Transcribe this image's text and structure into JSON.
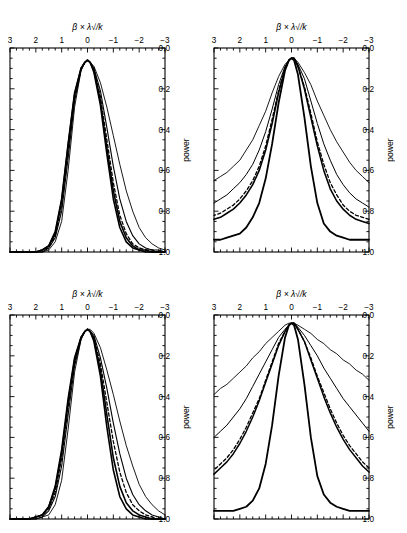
{
  "figure": {
    "kind": "multi-panel-line-plot",
    "orientation": "rotated-180",
    "panel_count": 4,
    "line_color": "#000000"
  },
  "axes": {
    "xlabel": "β × λ√/k",
    "ylabel": "power",
    "xticks": [
      "-3",
      "-2",
      "-1",
      "0",
      "1",
      "2",
      "3"
    ],
    "yticks": [
      "0.0",
      "0.2",
      "0.4",
      "0.6",
      "0.8",
      "1.0"
    ],
    "xlim": [
      -3,
      3
    ],
    "ylim": [
      0.0,
      1.0
    ]
  },
  "panels": {
    "a": {
      "label": "(a) λ√/k = 0.5",
      "key": "0.5"
    },
    "b": {
      "label": "(b) λ√/k = 1.0",
      "key": "1.0"
    },
    "c": {
      "label": "(c) λ√/k = 4.0",
      "key": "4.0"
    },
    "d": {
      "label": "(d) λ√/k = 16.0",
      "key": "16.0"
    }
  },
  "chart_data": [
    {
      "type": "line",
      "panel": "a",
      "title": "(a) λ√/k = 0.5",
      "xlabel": "β × λ√/k",
      "ylabel": "power",
      "xlim": [
        -3,
        3
      ],
      "ylim": [
        0.0,
        1.0
      ],
      "grid": false,
      "legend": false,
      "x": [
        -3,
        -2.75,
        -2.5,
        -2.25,
        -2,
        -1.75,
        -1.5,
        -1.25,
        -1,
        -0.75,
        -0.5,
        -0.25,
        -0.1,
        0,
        0.1,
        0.25,
        0.5,
        0.75,
        1,
        1.25,
        1.5,
        1.75,
        2,
        2.25,
        2.5,
        2.75,
        3
      ],
      "series": [
        {
          "name": "curve-1",
          "style": "solid",
          "width": 1.6,
          "values": [
            1.0,
            1.0,
            1.0,
            1.0,
            0.99,
            0.98,
            0.95,
            0.88,
            0.74,
            0.52,
            0.28,
            0.12,
            0.07,
            0.06,
            0.07,
            0.1,
            0.22,
            0.47,
            0.74,
            0.9,
            0.97,
            0.99,
            1.0,
            1.0,
            1.0,
            1.0,
            1.0
          ]
        },
        {
          "name": "curve-2",
          "style": "solid",
          "width": 1.6,
          "values": [
            1.0,
            1.0,
            1.0,
            0.99,
            0.99,
            0.97,
            0.93,
            0.85,
            0.7,
            0.49,
            0.26,
            0.11,
            0.07,
            0.06,
            0.07,
            0.1,
            0.23,
            0.48,
            0.75,
            0.91,
            0.97,
            0.99,
            1.0,
            1.0,
            1.0,
            1.0,
            1.0
          ]
        },
        {
          "name": "curve-3",
          "style": "dashed",
          "width": 1.3,
          "values": [
            1.0,
            1.0,
            0.99,
            0.99,
            0.98,
            0.96,
            0.91,
            0.82,
            0.66,
            0.45,
            0.24,
            0.1,
            0.07,
            0.06,
            0.07,
            0.1,
            0.24,
            0.5,
            0.77,
            0.92,
            0.98,
            0.99,
            1.0,
            1.0,
            1.0,
            1.0,
            1.0
          ]
        },
        {
          "name": "curve-4",
          "style": "solid",
          "width": 1.1,
          "values": [
            1.0,
            0.99,
            0.99,
            0.98,
            0.96,
            0.92,
            0.85,
            0.74,
            0.58,
            0.39,
            0.21,
            0.1,
            0.07,
            0.06,
            0.07,
            0.11,
            0.26,
            0.54,
            0.8,
            0.93,
            0.98,
            1.0,
            1.0,
            1.0,
            1.0,
            1.0,
            1.0
          ]
        },
        {
          "name": "curve-5",
          "style": "solid",
          "width": 0.9,
          "values": [
            0.99,
            0.98,
            0.96,
            0.93,
            0.88,
            0.8,
            0.7,
            0.57,
            0.43,
            0.29,
            0.17,
            0.09,
            0.07,
            0.06,
            0.07,
            0.11,
            0.29,
            0.6,
            0.85,
            0.95,
            0.99,
            1.0,
            1.0,
            1.0,
            1.0,
            1.0,
            1.0
          ]
        }
      ]
    },
    {
      "type": "line",
      "panel": "b",
      "title": "(b) λ√/k = 1.0",
      "xlabel": "β × λ√/k",
      "ylabel": "power",
      "xlim": [
        -3,
        3
      ],
      "ylim": [
        0.0,
        1.0
      ],
      "grid": false,
      "legend": false,
      "x": [
        -3,
        -2.75,
        -2.5,
        -2.25,
        -2,
        -1.75,
        -1.5,
        -1.25,
        -1,
        -0.75,
        -0.5,
        -0.25,
        -0.1,
        0,
        0.1,
        0.25,
        0.5,
        0.75,
        1,
        1.25,
        1.5,
        1.75,
        2,
        2.25,
        2.5,
        2.75,
        3
      ],
      "series": [
        {
          "name": "curve-1",
          "style": "solid",
          "width": 1.6,
          "values": [
            1.0,
            1.0,
            1.0,
            1.0,
            0.99,
            0.98,
            0.95,
            0.89,
            0.76,
            0.55,
            0.3,
            0.13,
            0.08,
            0.07,
            0.08,
            0.11,
            0.21,
            0.41,
            0.66,
            0.84,
            0.94,
            0.98,
            0.99,
            1.0,
            1.0,
            1.0,
            1.0
          ]
        },
        {
          "name": "curve-2",
          "style": "solid",
          "width": 1.6,
          "values": [
            1.0,
            1.0,
            1.0,
            0.99,
            0.98,
            0.96,
            0.92,
            0.84,
            0.7,
            0.49,
            0.27,
            0.12,
            0.08,
            0.07,
            0.08,
            0.11,
            0.22,
            0.43,
            0.68,
            0.85,
            0.94,
            0.98,
            0.99,
            1.0,
            1.0,
            1.0,
            1.0
          ]
        },
        {
          "name": "curve-3",
          "style": "dashed",
          "width": 1.3,
          "values": [
            1.0,
            1.0,
            0.99,
            0.98,
            0.96,
            0.93,
            0.87,
            0.77,
            0.62,
            0.43,
            0.24,
            0.11,
            0.08,
            0.07,
            0.08,
            0.11,
            0.23,
            0.45,
            0.7,
            0.87,
            0.95,
            0.98,
            0.99,
            1.0,
            1.0,
            1.0,
            1.0
          ]
        },
        {
          "name": "curve-4",
          "style": "solid",
          "width": 1.1,
          "values": [
            1.0,
            0.99,
            0.98,
            0.96,
            0.93,
            0.88,
            0.8,
            0.68,
            0.53,
            0.36,
            0.21,
            0.1,
            0.08,
            0.07,
            0.08,
            0.12,
            0.25,
            0.49,
            0.74,
            0.89,
            0.96,
            0.99,
            1.0,
            1.0,
            1.0,
            1.0,
            1.0
          ]
        },
        {
          "name": "curve-5",
          "style": "solid",
          "width": 0.9,
          "values": [
            0.98,
            0.96,
            0.93,
            0.89,
            0.83,
            0.74,
            0.64,
            0.52,
            0.39,
            0.27,
            0.16,
            0.09,
            0.07,
            0.07,
            0.08,
            0.12,
            0.28,
            0.56,
            0.81,
            0.93,
            0.98,
            0.99,
            1.0,
            1.0,
            1.0,
            1.0,
            1.0
          ]
        }
      ]
    },
    {
      "type": "line",
      "panel": "c",
      "title": "(c) λ√/k = 4.0",
      "xlabel": "β × λ√/k",
      "ylabel": "power",
      "xlim": [
        -3,
        3
      ],
      "ylim": [
        0.0,
        1.0
      ],
      "grid": false,
      "legend": false,
      "x": [
        -3,
        -2.75,
        -2.5,
        -2.25,
        -2,
        -1.75,
        -1.5,
        -1.25,
        -1,
        -0.75,
        -0.5,
        -0.25,
        -0.1,
        0,
        0.1,
        0.25,
        0.5,
        0.75,
        1,
        1.25,
        1.5,
        1.75,
        2,
        2.25,
        2.5,
        2.75,
        3
      ],
      "series": [
        {
          "name": "curve-1",
          "style": "solid",
          "width": 1.8,
          "values": [
            0.94,
            0.94,
            0.94,
            0.94,
            0.93,
            0.92,
            0.9,
            0.86,
            0.76,
            0.58,
            0.34,
            0.13,
            0.06,
            0.05,
            0.06,
            0.11,
            0.27,
            0.47,
            0.64,
            0.76,
            0.83,
            0.88,
            0.91,
            0.92,
            0.93,
            0.94,
            0.94
          ]
        },
        {
          "name": "curve-2",
          "style": "solid",
          "width": 1.6,
          "values": [
            0.86,
            0.85,
            0.84,
            0.82,
            0.79,
            0.75,
            0.69,
            0.6,
            0.48,
            0.34,
            0.2,
            0.09,
            0.05,
            0.05,
            0.06,
            0.1,
            0.22,
            0.37,
            0.5,
            0.6,
            0.67,
            0.72,
            0.76,
            0.79,
            0.81,
            0.83,
            0.84
          ]
        },
        {
          "name": "curve-3",
          "style": "dashed",
          "width": 1.3,
          "values": [
            0.84,
            0.83,
            0.82,
            0.8,
            0.77,
            0.72,
            0.66,
            0.57,
            0.46,
            0.32,
            0.19,
            0.09,
            0.05,
            0.05,
            0.06,
            0.1,
            0.21,
            0.35,
            0.48,
            0.58,
            0.65,
            0.7,
            0.74,
            0.77,
            0.79,
            0.81,
            0.82
          ]
        },
        {
          "name": "curve-4",
          "style": "solid",
          "width": 1.0,
          "values": [
            0.78,
            0.76,
            0.74,
            0.71,
            0.67,
            0.62,
            0.55,
            0.47,
            0.37,
            0.26,
            0.15,
            0.08,
            0.05,
            0.05,
            0.06,
            0.09,
            0.18,
            0.3,
            0.41,
            0.5,
            0.57,
            0.62,
            0.66,
            0.69,
            0.72,
            0.74,
            0.76
          ]
        },
        {
          "name": "curve-5",
          "style": "solid",
          "width": 0.9,
          "values": [
            0.66,
            0.63,
            0.6,
            0.56,
            0.51,
            0.46,
            0.4,
            0.33,
            0.26,
            0.18,
            0.12,
            0.07,
            0.05,
            0.05,
            0.06,
            0.08,
            0.14,
            0.22,
            0.31,
            0.38,
            0.45,
            0.5,
            0.55,
            0.58,
            0.61,
            0.63,
            0.65
          ]
        }
      ]
    },
    {
      "type": "line",
      "panel": "d",
      "title": "(d) λ√/k = 16.0",
      "xlabel": "β × λ√/k",
      "ylabel": "power",
      "xlim": [
        -3,
        3
      ],
      "ylim": [
        0.0,
        1.0
      ],
      "grid": false,
      "legend": false,
      "x": [
        -3,
        -2.75,
        -2.5,
        -2.25,
        -2,
        -1.75,
        -1.5,
        -1.25,
        -1,
        -0.75,
        -0.5,
        -0.25,
        -0.1,
        0,
        0.1,
        0.25,
        0.5,
        0.75,
        1,
        1.25,
        1.5,
        1.75,
        2,
        2.25,
        2.5,
        2.75,
        3
      ],
      "series": [
        {
          "name": "curve-1",
          "style": "solid",
          "width": 1.8,
          "values": [
            0.96,
            0.96,
            0.96,
            0.96,
            0.95,
            0.94,
            0.92,
            0.88,
            0.79,
            0.6,
            0.34,
            0.12,
            0.05,
            0.04,
            0.05,
            0.11,
            0.3,
            0.54,
            0.73,
            0.85,
            0.91,
            0.94,
            0.95,
            0.96,
            0.96,
            0.96,
            0.96
          ]
        },
        {
          "name": "curve-2",
          "style": "solid",
          "width": 1.5,
          "values": [
            0.77,
            0.74,
            0.7,
            0.66,
            0.61,
            0.55,
            0.48,
            0.4,
            0.31,
            0.22,
            0.13,
            0.07,
            0.04,
            0.04,
            0.05,
            0.08,
            0.15,
            0.24,
            0.33,
            0.42,
            0.5,
            0.57,
            0.63,
            0.68,
            0.72,
            0.75,
            0.78
          ]
        },
        {
          "name": "curve-3",
          "style": "dashed",
          "width": 1.3,
          "values": [
            0.75,
            0.72,
            0.68,
            0.64,
            0.59,
            0.53,
            0.46,
            0.38,
            0.3,
            0.21,
            0.13,
            0.07,
            0.04,
            0.04,
            0.05,
            0.08,
            0.14,
            0.23,
            0.32,
            0.41,
            0.48,
            0.55,
            0.61,
            0.66,
            0.7,
            0.73,
            0.76
          ]
        },
        {
          "name": "curve-4",
          "style": "solid",
          "width": 1.0,
          "values": [
            0.57,
            0.53,
            0.49,
            0.45,
            0.41,
            0.36,
            0.31,
            0.26,
            0.2,
            0.15,
            0.1,
            0.06,
            0.04,
            0.04,
            0.05,
            0.07,
            0.11,
            0.17,
            0.23,
            0.29,
            0.35,
            0.41,
            0.46,
            0.5,
            0.54,
            0.57,
            0.6
          ]
        },
        {
          "name": "curve-5",
          "style": "solid",
          "width": 0.9,
          "values": [
            0.32,
            0.29,
            0.27,
            0.24,
            0.22,
            0.19,
            0.17,
            0.14,
            0.12,
            0.09,
            0.07,
            0.05,
            0.04,
            0.04,
            0.04,
            0.05,
            0.08,
            0.11,
            0.14,
            0.18,
            0.21,
            0.25,
            0.28,
            0.31,
            0.34,
            0.36,
            0.39
          ]
        }
      ]
    }
  ]
}
